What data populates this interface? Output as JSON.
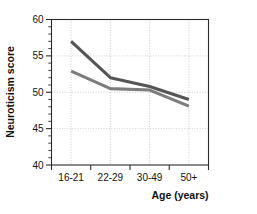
{
  "chart_data": {
    "type": "line",
    "title": "",
    "xlabel": "Age (years)",
    "ylabel": "Neuroticism score",
    "categories": [
      "16-21",
      "22-29",
      "30-49",
      "50+"
    ],
    "ylim": [
      40,
      60
    ],
    "y_ticks": [
      40,
      45,
      50,
      55,
      60
    ],
    "y_tick_labels": [
      "40",
      "45",
      "50",
      "55",
      "60"
    ],
    "y_minor_tick_step": 1,
    "grid": true,
    "grid_axes": "both",
    "legend": "none",
    "series": [
      {
        "name": "series-upper",
        "color": "#555555",
        "values": [
          57.0,
          52.0,
          50.8,
          49.0
        ]
      },
      {
        "name": "series-lower",
        "color": "#7d7d7d",
        "values": [
          52.9,
          50.5,
          50.3,
          48.1
        ]
      }
    ]
  },
  "axes": {
    "y_axis_title": "Neuroticism score",
    "x_axis_title": "Age (years)",
    "y_labels": [
      "60",
      "55",
      "50",
      "45",
      "40"
    ],
    "x_labels": [
      "16-21",
      "22-29",
      "30-49",
      "50+"
    ]
  }
}
